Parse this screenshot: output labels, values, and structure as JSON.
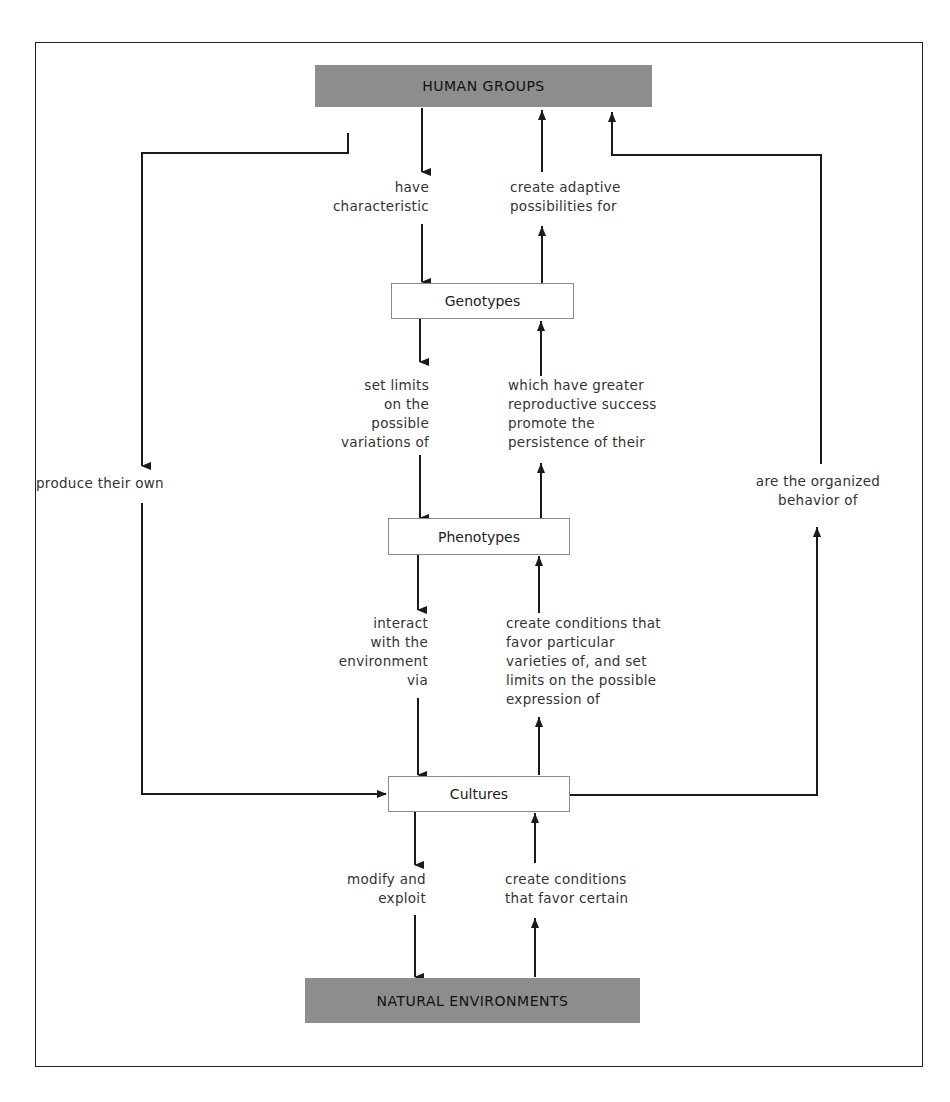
{
  "nodes": {
    "human_groups": "HUMAN GROUPS",
    "genotypes": "Genotypes",
    "phenotypes": "Phenotypes",
    "cultures": "Cultures",
    "natural_environments": "NATURAL ENVIRONMENTS"
  },
  "edges": {
    "have_characteristic": [
      "have",
      "characteristic"
    ],
    "create_adaptive": [
      "create adaptive",
      "possibilities for"
    ],
    "set_limits": [
      "set limits",
      "on the",
      "possible",
      "variations of"
    ],
    "reproductive_success": [
      "which have greater",
      "reproductive success",
      "promote the",
      "persistence of their"
    ],
    "interact": [
      "interact",
      "with the",
      "environment",
      "via"
    ],
    "create_conditions_favor": [
      "create conditions that",
      "favor particular",
      "varieties of, and set",
      "limits on the possible",
      "expression of"
    ],
    "modify_exploit": [
      "modify and",
      "exploit"
    ],
    "create_conditions_certain": [
      "create conditions",
      "that favor certain"
    ],
    "produce_their_own": [
      "produce their own"
    ],
    "organized_behavior": [
      "are the organized",
      "behavior of"
    ]
  },
  "colors": {
    "gray_box": "#8d8d8d",
    "line": "#1a1a1a",
    "white_box_border": "#8a8a8a"
  }
}
